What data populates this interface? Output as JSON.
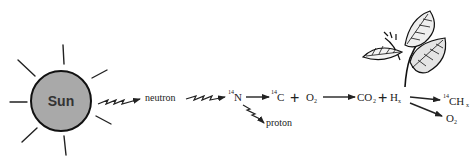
{
  "diagram": {
    "sun": {
      "label": "Sun",
      "fill": "#a8a8a8",
      "stroke": "#111111"
    },
    "nodes": {
      "neutron": "neutron",
      "nitrogen": {
        "sup": "14",
        "sym": "N"
      },
      "proton": "proton",
      "carbon": {
        "sup": "14",
        "sym": "C"
      },
      "plus1": "+",
      "oxygen": {
        "sym": "O",
        "sub": "2"
      },
      "co2": {
        "sym": "CO",
        "sub": "2"
      },
      "plus2": "+",
      "hx": {
        "sym": "H",
        "sub": "x"
      },
      "chx": {
        "sup": "14",
        "sym": "CH",
        "sub": "x"
      },
      "o2_out": {
        "sym": "O",
        "sub": "2"
      }
    },
    "edges": [
      {
        "from": "sun",
        "to": "neutron",
        "style": "zigzag"
      },
      {
        "from": "neutron",
        "to": "nitrogen",
        "style": "zigzag"
      },
      {
        "from": "nitrogen",
        "to": "carbon",
        "style": "straight"
      },
      {
        "from": "nitrogen",
        "to": "proton",
        "style": "zigzag"
      },
      {
        "from": "oxygen",
        "to": "co2",
        "style": "straight"
      },
      {
        "from": "hx",
        "to": "chx",
        "style": "straight"
      },
      {
        "from": "hx",
        "to": "o2_out",
        "style": "straight"
      }
    ],
    "plant_icon": "leaf-sprig-icon"
  }
}
